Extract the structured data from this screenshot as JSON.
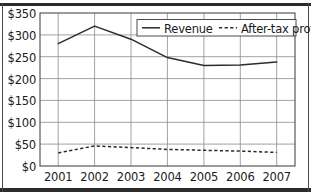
{
  "chart_data": {
    "type": "line",
    "title": "",
    "xlabel": "",
    "ylabel": "",
    "categories": [
      "2001",
      "2002",
      "2003",
      "2004",
      "2005",
      "2006",
      "2007"
    ],
    "x": [
      2001,
      2002,
      2003,
      2004,
      2005,
      2006,
      2007
    ],
    "series": [
      {
        "name": "Revenue",
        "style": "solid",
        "color": "#2b2b2b",
        "values": [
          280,
          320,
          290,
          248,
          230,
          231,
          238
        ]
      },
      {
        "name": "After-tax profit",
        "style": "dashed",
        "color": "#2b2b2b",
        "values": [
          30,
          46,
          42,
          38,
          36,
          34,
          31
        ]
      }
    ],
    "ylim": [
      0,
      350
    ],
    "xlim": [
      2000.5,
      2007.5
    ],
    "yticks": [
      0,
      50,
      100,
      150,
      200,
      250,
      300,
      350
    ],
    "ytick_labels": [
      "$0",
      "$50",
      "$100",
      "$150",
      "$200",
      "$250",
      "$300",
      "$350"
    ],
    "xtick_labels": [
      "2001",
      "2002",
      "2003",
      "2004",
      "2005",
      "2006",
      "2007"
    ],
    "grid": true,
    "grid_color": "#808080",
    "axis_color": "#4a4a4a",
    "legend_position": "top-right",
    "legend_entries": [
      {
        "label": "Revenue",
        "style": "solid"
      },
      {
        "label": "After-tax profit",
        "style": "dashed"
      }
    ],
    "currency_prefix": "$"
  },
  "axes": {
    "y_labels": {
      "t0": "$350",
      "t1": "$300",
      "t2": "$250",
      "t3": "$200",
      "t4": "$150",
      "t5": "$100",
      "t6": "$50",
      "t7": "$0"
    },
    "x_labels": {
      "t0": "2001",
      "t1": "2002",
      "t2": "2003",
      "t3": "2004",
      "t4": "2005",
      "t5": "2006",
      "t6": "2007"
    }
  },
  "legend": {
    "revenue_label": "Revenue",
    "profit_label": "After-tax profit"
  }
}
